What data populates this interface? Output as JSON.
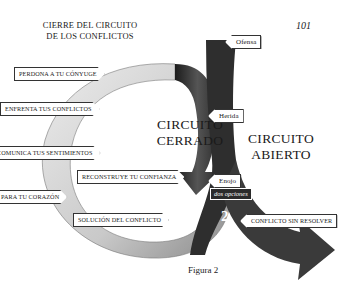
{
  "header": {
    "title_line1": "CIERRE DEL CIRCUITO",
    "title_line2": "DE LOS CONFLICTOS",
    "page_number": "101"
  },
  "closed_circuit": {
    "label_line1": "CIRCUITO",
    "label_line2": "CERRADO",
    "number": "1",
    "steps": [
      "Perdona a tu Cónyuge",
      "Enfrenta tus Conflictos",
      "Comunica tus Sentimientos",
      "para tu Corazón",
      "Reconstruye tu Confianza",
      "Solución del Conflicto"
    ]
  },
  "open_circuit": {
    "label_line1": "CIRCUITO",
    "label_line2": "ABIERTO",
    "number": "2",
    "steps": [
      "Ofensa",
      "Herida",
      "Enojo"
    ],
    "choice_note": "dos opciones",
    "outcome": "Conflicto sin Resolver"
  },
  "caption": "Figura 2",
  "colors": {
    "dark_arrow": "#2b2b2b",
    "light_ring": "#cfcfcf",
    "background": "#ffffff"
  }
}
